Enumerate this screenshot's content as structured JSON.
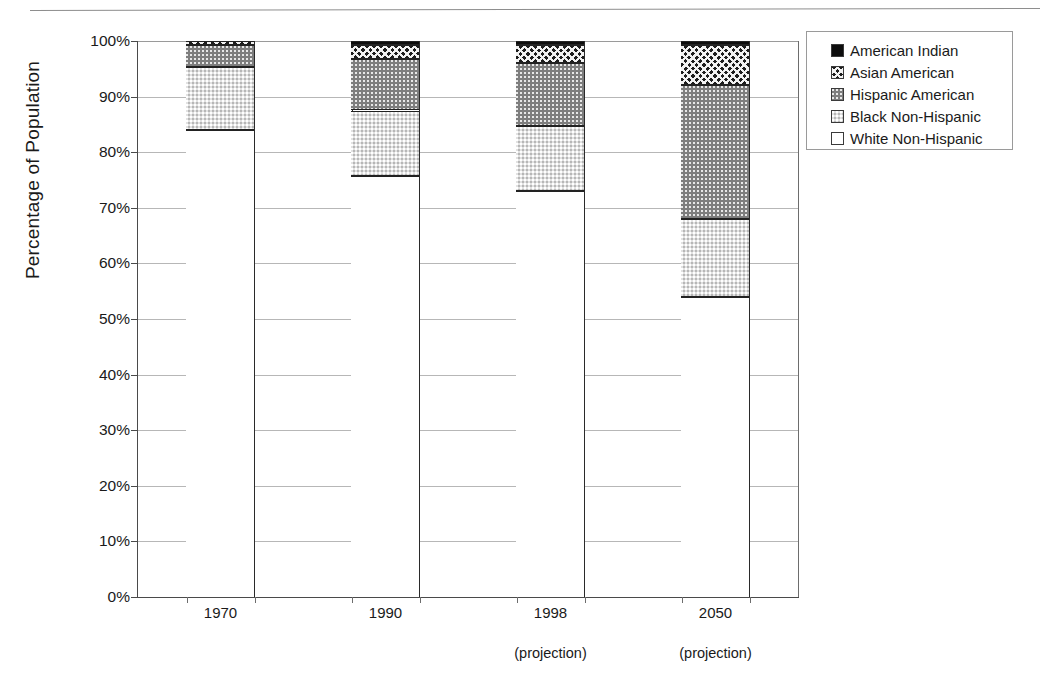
{
  "chart_data": {
    "type": "bar",
    "subtype": "stacked-percentage-column",
    "title": "",
    "xlabel": "",
    "ylabel": "Percentage of Population",
    "ylim": [
      0,
      100
    ],
    "ytick_labels": [
      "100%",
      "90%",
      "80%",
      "70%",
      "60%",
      "50%",
      "40%",
      "30%",
      "20%",
      "10%",
      "0%"
    ],
    "ytick_values": [
      100,
      90,
      80,
      70,
      60,
      50,
      40,
      30,
      20,
      10,
      0
    ],
    "grid": true,
    "legend_position": "top-right",
    "categories": [
      "1970",
      "1990",
      "1998",
      "2050"
    ],
    "category_sublabels": [
      "",
      "",
      "(projection)",
      "(projection)"
    ],
    "series": [
      {
        "name": "White Non-Hispanic",
        "pattern": "white",
        "color": "#ffffff",
        "values": [
          84.0,
          75.7,
          73.0,
          54.0
        ]
      },
      {
        "name": "Black Non-Hispanic",
        "pattern": "light-dotted",
        "color": "#e2e2e2",
        "values": [
          11.3,
          11.8,
          11.8,
          14.0
        ]
      },
      {
        "name": "Hispanic American",
        "pattern": "dark-dotted",
        "color": "#7e7e7e",
        "values": [
          3.9,
          9.3,
          11.2,
          24.0
        ]
      },
      {
        "name": "Asian American",
        "pattern": "diagonal-hatch",
        "color": "#1d1d1d",
        "values": [
          0.8,
          2.4,
          3.2,
          7.2
        ]
      },
      {
        "name": "American Indian",
        "pattern": "solid-black",
        "color": "#0d0d0d",
        "values": [
          0.0,
          0.8,
          0.8,
          0.8
        ]
      }
    ],
    "cumulative_tops": {
      "1970": [
        84.0,
        95.3,
        99.2,
        100.0,
        100.0
      ],
      "1990": [
        75.7,
        87.5,
        96.8,
        99.2,
        100.0
      ],
      "1998": [
        73.0,
        84.8,
        96.0,
        99.2,
        100.0
      ],
      "2050": [
        54.0,
        68.0,
        92.0,
        99.2,
        100.0
      ]
    }
  },
  "legend": {
    "items": [
      {
        "label": "American Indian"
      },
      {
        "label": "Asian American"
      },
      {
        "label": "Hispanic American"
      },
      {
        "label": "Black Non-Hispanic"
      },
      {
        "label": "White Non-Hispanic"
      }
    ]
  }
}
